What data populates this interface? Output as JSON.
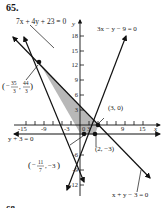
{
  "problem_number": "65.",
  "footer_number": "68.",
  "axes": {
    "x_label": "x",
    "y_label": "y",
    "x_ticks": [
      "-15",
      "-9",
      "-3",
      "3",
      "9",
      "15"
    ],
    "y_ticks": [
      "18",
      "15",
      "12",
      "9",
      "6",
      "3",
      "-6",
      "-9",
      "-12"
    ],
    "origin_label": "0"
  },
  "lines": [
    {
      "equation": "7x + 4y + 23 = 0"
    },
    {
      "equation": "3x − y − 9 = 0"
    },
    {
      "equation": "y + 3 = 0"
    },
    {
      "equation": "x + y − 3 = 0"
    }
  ],
  "points": [
    {
      "label": "(−35/3, 44/3)",
      "num1": "35",
      "den1": "3",
      "num2": "44",
      "den2": "3"
    },
    {
      "label": "(3, 0)"
    },
    {
      "label": "(2, −3)"
    },
    {
      "label": "(−11/7, −3)",
      "num1": "11",
      "den1": "7",
      "y": "−3"
    }
  ],
  "colors": {
    "shade": "#b8b8b8",
    "ink": "#111111"
  }
}
